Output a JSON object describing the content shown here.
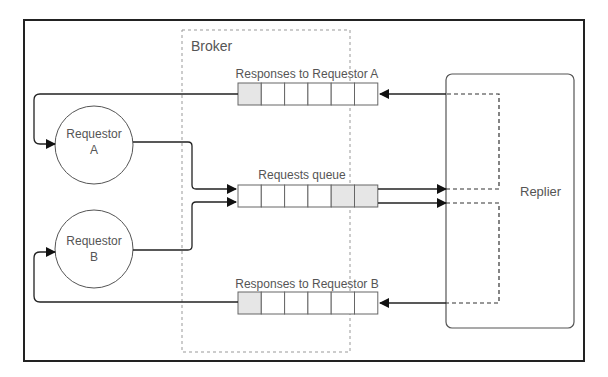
{
  "broker": {
    "label": "Broker"
  },
  "queues": {
    "responses_a": {
      "label": "Responses to Requestor A",
      "cells": 6,
      "filled": [
        0
      ]
    },
    "requests": {
      "label": "Requests queue",
      "cells": 6,
      "filled": [
        4,
        5
      ]
    },
    "responses_b": {
      "label": "Responses to Requestor B",
      "cells": 6,
      "filled": [
        0
      ]
    }
  },
  "requestors": [
    {
      "line1": "Requestor",
      "line2": "A"
    },
    {
      "line1": "Requestor",
      "line2": "B"
    }
  ],
  "replier": {
    "label": "Replier"
  },
  "colors": {
    "frame": "#222222",
    "line": "#333333",
    "dashed": "#888888",
    "filled_cell": "#e6e6e6",
    "cell_border": "#666666",
    "text": "#555555"
  }
}
